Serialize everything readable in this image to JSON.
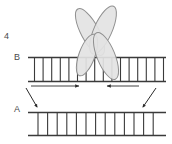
{
  "figure": {
    "index_label": "4",
    "caption_labels": {
      "upper_strand": "B",
      "lower_strand": "A"
    },
    "type": "schematic-diagram",
    "colors": {
      "stroke": "#3a3a3a",
      "ellipse_fill": "#e3e3e3",
      "ellipse_stroke": "#8f8f8f",
      "arrow": "#2b2b2b",
      "background": "#ffffff",
      "label_text": "#4a4a4a"
    },
    "elements": {
      "x_complex": {
        "name": "four-lobed-x-shape",
        "lobe_count": 4,
        "lobes": [
          {
            "id": "upper-left",
            "cx": 90,
            "cy": 32,
            "rx": 9,
            "ry": 26,
            "rotate": -28
          },
          {
            "id": "upper-right",
            "cx": 103,
            "cy": 30,
            "rx": 9,
            "ry": 26,
            "rotate": 24
          },
          {
            "id": "lower-left",
            "cx": 87,
            "cy": 55,
            "rx": 8,
            "ry": 22,
            "rotate": 20
          },
          {
            "id": "lower-right",
            "cx": 106,
            "cy": 56,
            "rx": 9,
            "ry": 25,
            "rotate": -22
          }
        ]
      },
      "upper_ladder": {
        "name": "ladder-b",
        "x_start": 28,
        "x_end": 166,
        "y_top": 57,
        "y_bottom": 82,
        "rung_count": 16
      },
      "lower_ladder": {
        "name": "ladder-a",
        "x_start": 28,
        "x_end": 166,
        "y_top": 112,
        "y_bottom": 136,
        "rung_count": 13
      },
      "horizontal_arrows": [
        {
          "id": "left-inward-arrow",
          "direction": "right",
          "x1": 31,
          "x2": 79,
          "y": 86
        },
        {
          "id": "right-inward-arrow",
          "direction": "left",
          "x1": 139,
          "x2": 107,
          "y": 86
        }
      ],
      "diagonal_arrows": [
        {
          "id": "left-diagonal-arrow",
          "x1": 27,
          "y1": 89,
          "x2": 38,
          "y2": 107
        },
        {
          "id": "right-diagonal-arrow",
          "x1": 155,
          "y1": 89,
          "x2": 142,
          "y2": 107
        }
      ]
    }
  }
}
